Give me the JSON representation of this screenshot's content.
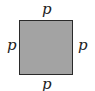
{
  "diagram": {
    "shape": "square",
    "fill_color": "#a3a3a3",
    "border_color": "#2a2a2a",
    "labels": {
      "top": "p",
      "bottom": "p",
      "left": "p",
      "right": "p"
    }
  }
}
